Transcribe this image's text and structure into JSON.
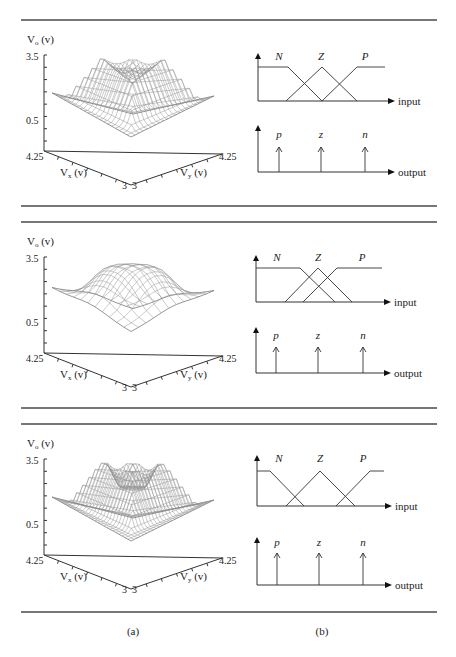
{
  "figure": {
    "captions": [
      {
        "label": "(a)",
        "x": 133,
        "y": 635
      },
      {
        "label": "(b)",
        "x": 322,
        "y": 635
      }
    ],
    "rules_y": [
      20,
      206,
      222,
      408,
      424,
      612
    ],
    "rule_x": [
      21,
      437
    ]
  },
  "chart_data": [
    {
      "type": "surface3d",
      "panel": 1,
      "title": "",
      "zlabel": "V_o (v)",
      "xlabel": "V_x (v)",
      "ylabel": "V_y (v)",
      "z_ticks": [
        "3.5",
        "0.5"
      ],
      "x_range": [
        "3",
        "4.25"
      ],
      "y_range": [
        "3",
        "4.25"
      ],
      "zlim": [
        0.5,
        3.5
      ],
      "shape": "hexagonal plateau, sharp piecewise-linear transitions, saddle in center"
    },
    {
      "type": "membership",
      "panel": 1,
      "input": {
        "axis_label": "input",
        "sets": [
          "N",
          "Z",
          "P"
        ],
        "overlap": "moderate (triangles cross at half height)"
      },
      "output": {
        "axis_label": "output",
        "singletons": [
          "p",
          "z",
          "n"
        ]
      }
    },
    {
      "type": "surface3d",
      "panel": 2,
      "zlabel": "V_o (v)",
      "xlabel": "V_x (v)",
      "ylabel": "V_y (v)",
      "z_ticks": [
        "3.5",
        "0.5"
      ],
      "x_range": [
        "3",
        "4.25"
      ],
      "y_range": [
        "3",
        "4.25"
      ],
      "zlim": [
        0.5,
        3.5
      ],
      "shape": "smooth dome, coarse grid"
    },
    {
      "type": "membership",
      "panel": 2,
      "input": {
        "axis_label": "input",
        "sets": [
          "N",
          "Z",
          "P"
        ],
        "overlap": "heavy (narrow, strongly overlapping)"
      },
      "output": {
        "axis_label": "output",
        "singletons": [
          "p",
          "z",
          "n"
        ]
      }
    },
    {
      "type": "surface3d",
      "panel": 3,
      "zlabel": "V_o (v)",
      "xlabel": "V_x (v)",
      "ylabel": "V_y (v)",
      "z_ticks": [
        "3.5",
        "0.5"
      ],
      "x_range": [
        "3",
        "4.25"
      ],
      "y_range": [
        "3",
        "4.25"
      ],
      "zlim": [
        0.5,
        3.5
      ],
      "shape": "hexagonal plateau with flat center step, fine grid"
    },
    {
      "type": "membership",
      "panel": 3,
      "input": {
        "axis_label": "input",
        "sets": [
          "N",
          "Z",
          "P"
        ],
        "overlap": "light (sets barely overlap near baseline)"
      },
      "output": {
        "axis_label": "output",
        "singletons": [
          "p",
          "z",
          "n"
        ]
      }
    }
  ],
  "panels": [
    {
      "surface": {
        "origin_y": 0,
        "zlabel_main": "V",
        "zlabel_sub": "o",
        "zlabel_unit": " (v)",
        "ztick_top": "3.5",
        "ztick_bottom": "0.5",
        "xtick_far": "4.25",
        "xtick_near": "3",
        "ytick_near": "3",
        "ytick_far": "4.25",
        "xlabel_main": "V",
        "xlabel_sub": "x",
        "xlabel_unit": " (v)",
        "ylabel_main": "V",
        "ylabel_sub": "y",
        "ylabel_unit": " (v)",
        "style": "hex",
        "grid": 20
      },
      "mf": {
        "ax": 258,
        "top_arrow": 53,
        "top": 67,
        "base": 101,
        "end": 395,
        "N": [
          258,
          288,
          322
        ],
        "Z": [
          286,
          322,
          357
        ],
        "P": [
          322,
          357,
          385
        ],
        "labels": {
          "N": "N",
          "Z": "Z",
          "P": "P"
        },
        "label_x": [
          279,
          321,
          365
        ],
        "label_y": 60,
        "input_label": "input",
        "out_top_arrow": 125,
        "out_base": 172,
        "out_tip": 147,
        "singletons_x": [
          279,
          321,
          365
        ],
        "singleton_labels": [
          "p",
          "z",
          "n"
        ],
        "sl_y": 138,
        "output_label": "output"
      }
    },
    {
      "surface": {
        "origin_y": 202,
        "zlabel_main": "V",
        "zlabel_sub": "o",
        "zlabel_unit": " (v)",
        "ztick_top": "3.5",
        "ztick_bottom": "0.5",
        "xtick_far": "4.25",
        "xtick_near": "3",
        "ytick_near": "3",
        "ytick_far": "4.25",
        "xlabel_main": "V",
        "xlabel_sub": "x",
        "xlabel_unit": " (v)",
        "ylabel_main": "V",
        "ylabel_sub": "y",
        "ylabel_unit": " (v)",
        "style": "dome",
        "grid": 11
      },
      "mf": {
        "ax": 256,
        "top_arrow": 255,
        "top": 268,
        "base": 302,
        "end": 391,
        "N": [
          256,
          300,
          335
        ],
        "Z": [
          285,
          318,
          352
        ],
        "P": [
          303,
          337,
          382
        ],
        "labels": {
          "N": "N",
          "Z": "Z",
          "P": "P"
        },
        "label_x": [
          277,
          318,
          362
        ],
        "label_y": 261,
        "input_label": "input",
        "out_top_arrow": 327,
        "out_base": 373,
        "out_tip": 347,
        "singletons_x": [
          276,
          318,
          363
        ],
        "singleton_labels": [
          "p",
          "z",
          "n"
        ],
        "sl_y": 339,
        "output_label": "output"
      }
    },
    {
      "surface": {
        "origin_y": 404,
        "zlabel_main": "V",
        "zlabel_sub": "o",
        "zlabel_unit": " (v)",
        "ztick_top": "3.5",
        "ztick_bottom": "0.5",
        "xtick_far": "4.25",
        "xtick_near": "3",
        "ytick_near": "3",
        "ytick_far": "4.25",
        "xlabel_main": "V",
        "xlabel_sub": "x",
        "xlabel_unit": " (v)",
        "ylabel_main": "V",
        "ylabel_sub": "y",
        "ylabel_unit": " (v)",
        "style": "step",
        "grid": 26
      },
      "mf": {
        "ax": 257,
        "top_arrow": 455,
        "top": 471,
        "base": 506,
        "end": 392,
        "N": [
          257,
          270,
          304
        ],
        "Z": [
          286,
          320,
          355
        ],
        "P": [
          336,
          370,
          384
        ],
        "labels": {
          "N": "N",
          "Z": "Z",
          "P": "P"
        },
        "label_x": [
          279,
          320,
          363
        ],
        "label_y": 462,
        "input_label": "input",
        "out_top_arrow": 537,
        "out_base": 585,
        "out_tip": 553,
        "singletons_x": [
          277,
          319,
          363
        ],
        "singleton_labels": [
          "p",
          "z",
          "n"
        ],
        "sl_y": 546,
        "output_label": "output"
      }
    }
  ]
}
